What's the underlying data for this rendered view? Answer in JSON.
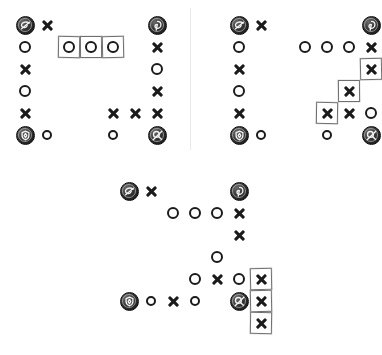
{
  "figure": {
    "title": "",
    "background_color": "#ffffff",
    "mark_color": "#1b1b1b",
    "box_color": "#6f6f6f",
    "divider_color": "#e9e9e9",
    "panel_count": 3,
    "layout": "two panels on top separated by a vertical divider, one panel centered below"
  },
  "legend": {
    "symbol_x": "x",
    "symbol_o": "o",
    "symbol_token": "token",
    "boxed_meaning": "highlighted cell"
  },
  "panels": [
    {
      "id": "panel-top-left",
      "name": "top-left-board",
      "origin": {
        "x": 14,
        "y": 14
      },
      "cell_size": 22,
      "cols": 7,
      "rows": 6,
      "cells": [
        {
          "r": 0,
          "c": 0,
          "type": "token",
          "icon": "token-swirl-icon",
          "boxed": false
        },
        {
          "r": 0,
          "c": 1,
          "type": "x",
          "boxed": false
        },
        {
          "r": 0,
          "c": 6,
          "type": "token",
          "icon": "token-loop-icon",
          "boxed": false
        },
        {
          "r": 1,
          "c": 0,
          "type": "o",
          "boxed": false
        },
        {
          "r": 1,
          "c": 2,
          "type": "o",
          "boxed": true
        },
        {
          "r": 1,
          "c": 3,
          "type": "o",
          "boxed": true
        },
        {
          "r": 1,
          "c": 4,
          "type": "o",
          "boxed": true
        },
        {
          "r": 1,
          "c": 6,
          "type": "x",
          "boxed": false
        },
        {
          "r": 2,
          "c": 0,
          "type": "x",
          "boxed": false
        },
        {
          "r": 2,
          "c": 6,
          "type": "o",
          "boxed": false
        },
        {
          "r": 3,
          "c": 0,
          "type": "o",
          "boxed": false
        },
        {
          "r": 3,
          "c": 6,
          "type": "x",
          "boxed": false
        },
        {
          "r": 4,
          "c": 0,
          "type": "x",
          "boxed": false
        },
        {
          "r": 4,
          "c": 4,
          "type": "x",
          "boxed": false
        },
        {
          "r": 4,
          "c": 5,
          "type": "x",
          "boxed": false
        },
        {
          "r": 4,
          "c": 6,
          "type": "x",
          "boxed": false
        },
        {
          "r": 5,
          "c": 0,
          "type": "token",
          "icon": "token-shield-icon",
          "boxed": false
        },
        {
          "r": 5,
          "c": 1,
          "type": "o-small",
          "boxed": false
        },
        {
          "r": 5,
          "c": 4,
          "type": "o-small",
          "boxed": false
        },
        {
          "r": 5,
          "c": 6,
          "type": "token",
          "icon": "token-key-icon",
          "boxed": false
        }
      ]
    },
    {
      "id": "panel-top-right",
      "name": "top-right-board",
      "origin": {
        "x": 228,
        "y": 14
      },
      "cell_size": 22,
      "cols": 7,
      "rows": 6,
      "cells": [
        {
          "r": 0,
          "c": 0,
          "type": "token",
          "icon": "token-swirl-icon",
          "boxed": false
        },
        {
          "r": 0,
          "c": 1,
          "type": "x",
          "boxed": false
        },
        {
          "r": 0,
          "c": 6,
          "type": "token",
          "icon": "token-loop-icon",
          "boxed": false
        },
        {
          "r": 1,
          "c": 0,
          "type": "o",
          "boxed": false
        },
        {
          "r": 1,
          "c": 3,
          "type": "o",
          "boxed": false
        },
        {
          "r": 1,
          "c": 4,
          "type": "o",
          "boxed": false
        },
        {
          "r": 1,
          "c": 5,
          "type": "o",
          "boxed": false
        },
        {
          "r": 1,
          "c": 6,
          "type": "x",
          "boxed": false
        },
        {
          "r": 2,
          "c": 0,
          "type": "x",
          "boxed": false
        },
        {
          "r": 2,
          "c": 6,
          "type": "x",
          "boxed": true
        },
        {
          "r": 3,
          "c": 0,
          "type": "o",
          "boxed": false
        },
        {
          "r": 3,
          "c": 5,
          "type": "x",
          "boxed": true
        },
        {
          "r": 4,
          "c": 0,
          "type": "x",
          "boxed": false
        },
        {
          "r": 4,
          "c": 4,
          "type": "x",
          "boxed": true
        },
        {
          "r": 4,
          "c": 5,
          "type": "x",
          "boxed": false
        },
        {
          "r": 4,
          "c": 6,
          "type": "o",
          "boxed": false
        },
        {
          "r": 5,
          "c": 0,
          "type": "token",
          "icon": "token-shield-icon",
          "boxed": false
        },
        {
          "r": 5,
          "c": 1,
          "type": "o-small",
          "boxed": false
        },
        {
          "r": 5,
          "c": 4,
          "type": "o-small",
          "boxed": false
        },
        {
          "r": 5,
          "c": 6,
          "type": "token",
          "icon": "token-key-icon",
          "boxed": false
        }
      ]
    },
    {
      "id": "panel-bottom",
      "name": "bottom-board",
      "origin": {
        "x": 118,
        "y": 180
      },
      "cell_size": 22,
      "cols": 8,
      "rows": 7,
      "cells": [
        {
          "r": 0,
          "c": 0,
          "type": "token",
          "icon": "token-swirl-icon",
          "boxed": false
        },
        {
          "r": 0,
          "c": 1,
          "type": "x",
          "boxed": false
        },
        {
          "r": 0,
          "c": 5,
          "type": "token",
          "icon": "token-loop-icon",
          "boxed": false
        },
        {
          "r": 1,
          "c": 2,
          "type": "o",
          "boxed": false
        },
        {
          "r": 1,
          "c": 3,
          "type": "o",
          "boxed": false
        },
        {
          "r": 1,
          "c": 4,
          "type": "o",
          "boxed": false
        },
        {
          "r": 1,
          "c": 5,
          "type": "x",
          "boxed": false
        },
        {
          "r": 2,
          "c": 5,
          "type": "x",
          "boxed": false
        },
        {
          "r": 3,
          "c": 4,
          "type": "o",
          "boxed": false
        },
        {
          "r": 4,
          "c": 3,
          "type": "o",
          "boxed": false
        },
        {
          "r": 4,
          "c": 4,
          "type": "x",
          "boxed": false
        },
        {
          "r": 4,
          "c": 5,
          "type": "o",
          "boxed": false
        },
        {
          "r": 4,
          "c": 6,
          "type": "x",
          "boxed": true
        },
        {
          "r": 5,
          "c": 0,
          "type": "token",
          "icon": "token-shield-icon",
          "boxed": false
        },
        {
          "r": 5,
          "c": 1,
          "type": "o-small",
          "boxed": false
        },
        {
          "r": 5,
          "c": 2,
          "type": "x",
          "boxed": false
        },
        {
          "r": 5,
          "c": 3,
          "type": "o-small",
          "boxed": false
        },
        {
          "r": 5,
          "c": 5,
          "type": "token",
          "icon": "token-key-icon",
          "boxed": false
        },
        {
          "r": 5,
          "c": 6,
          "type": "x",
          "boxed": true
        },
        {
          "r": 6,
          "c": 6,
          "type": "x",
          "boxed": true
        }
      ]
    }
  ],
  "divider": {
    "x": 190,
    "y": 8,
    "height": 142
  }
}
